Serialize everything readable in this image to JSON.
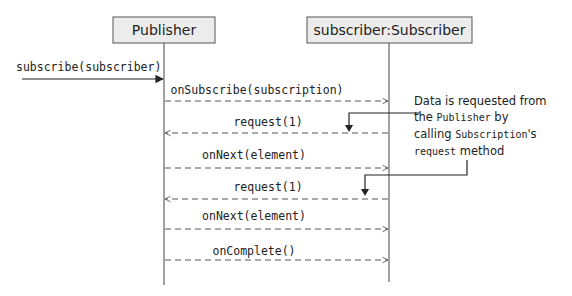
{
  "diagram": {
    "type": "sequence",
    "participants": [
      {
        "name": "Publisher",
        "x": 164
      },
      {
        "name": "subscriber:Subscriber",
        "x": 389
      }
    ],
    "messages": [
      {
        "label": "subscribe(subscriber)",
        "from": "external",
        "to": "Publisher",
        "style": "solid",
        "y": 78
      },
      {
        "label": "onSubscribe(subscription)",
        "from": "Publisher",
        "to": "subscriber:Subscriber",
        "style": "dashed",
        "y": 101
      },
      {
        "label": "request(1)",
        "from": "subscriber:Subscriber",
        "to": "Publisher",
        "style": "dashed",
        "y": 133
      },
      {
        "label": "onNext(element)",
        "from": "Publisher",
        "to": "subscriber:Subscriber",
        "style": "dashed",
        "y": 168
      },
      {
        "label": "request(1)",
        "from": "subscriber:Subscriber",
        "to": "Publisher",
        "style": "dashed",
        "y": 199
      },
      {
        "label": "onNext(element)",
        "from": "Publisher",
        "to": "subscriber:Subscriber",
        "style": "dashed",
        "y": 229
      },
      {
        "label": "onComplete()",
        "from": "Publisher",
        "to": "subscriber:Subscriber",
        "style": "dashed",
        "y": 260
      }
    ],
    "note": {
      "line1": "Data is requested from",
      "line2_a": "the ",
      "line2_code": "Publisher",
      "line2_b": " by",
      "line3_a": "calling ",
      "line3_code": "Subscription",
      "line3_b": "'s",
      "line4_code": "request",
      "line4_b": " method"
    },
    "colors": {
      "box_fill": "#ececec",
      "box_stroke": "#555555",
      "line": "#444444"
    }
  }
}
